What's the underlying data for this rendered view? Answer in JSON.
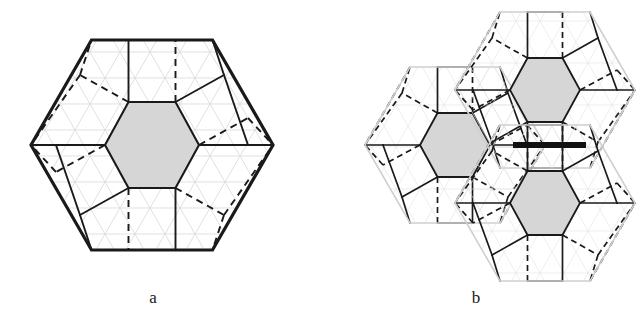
{
  "figure": {
    "type": "geometric-tiling-diagram",
    "panels": [
      {
        "id": "a",
        "caption": "a",
        "description": "Single hexagonal prototile with outer bold hexagon boundary, central shaded hexagon, six surrounding pentagonal cells, alternating solid and dashed internal edges, over a faint triangular lattice",
        "outer_hexagon": {
          "center": [
            152,
            145
          ],
          "radius_x": 121,
          "radius_y": 110,
          "orientation": "pointy-left-right",
          "stroke": "#1a1a1a",
          "stroke_width": 3.2,
          "fill": "#ffffff"
        },
        "inner_hexagon": {
          "center": [
            152,
            145
          ],
          "radius_x": 47,
          "radius_y": 43,
          "fill": "#d6d6d6",
          "stroke": "#1a1a1a",
          "stroke_width": 2.0
        },
        "lattice": {
          "visible": true,
          "stroke": "#d0d0d0",
          "stroke_width": 0.7,
          "cell_size": 30
        }
      },
      {
        "id": "b",
        "caption": "b",
        "description": "Three hexagonal prototiles assembled edge to edge in a pinwheel cluster; each has a shaded central hexagon; a thick black bar marks a matching edge between the two right hexagons",
        "tiles": [
          {
            "name": "left-hexagon",
            "center": [
              455,
              145
            ]
          },
          {
            "name": "top-right-hexagon",
            "center": [
              545,
              90
            ]
          },
          {
            "name": "bottom-right-hexagon",
            "center": [
              545,
              203
            ]
          }
        ],
        "tile_radius_x": 90,
        "tile_radius_y": 82,
        "tile_outline_stroke": "#cfcfcf",
        "tile_outline_width": 1.6,
        "inner_hexagon_fill": "#d6d6d6",
        "marker_bar": {
          "name": "edge-marker-bar",
          "x1": 513,
          "y1": 145,
          "x2": 586,
          "y2": 145,
          "color": "#111111",
          "thickness": 6
        }
      }
    ],
    "colors": {
      "ink": "#1a1a1a",
      "shade": "#d6d6d6",
      "faint_grid": "#d0d0d0",
      "tile_outline": "#cfcfcf",
      "background": "#ffffff",
      "marker": "#111111"
    },
    "line_styles": {
      "solid": "none",
      "dashed": "7,5"
    }
  }
}
